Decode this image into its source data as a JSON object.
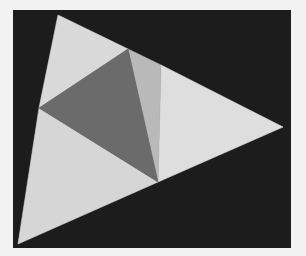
{
  "figure": {
    "background": {
      "x": 13,
      "y": 10,
      "width": 278,
      "height": 238,
      "color": "#1c1c1c"
    },
    "page_color": "#f2f2f2",
    "faces": [
      {
        "name": "top-left-face",
        "points": "58,15 128,49 39,108",
        "color": "#d9d9d9"
      },
      {
        "name": "bottom-left-face",
        "points": "39,108 158,182 18,244",
        "color": "#d6d6d6"
      },
      {
        "name": "right-face",
        "points": "161,65 283,127 158,182",
        "color": "#dedede"
      },
      {
        "name": "center-strip-face",
        "points": "128,49 161,65 158,182",
        "color": "#b9b9b9"
      },
      {
        "name": "center-dark-face",
        "points": "128,49 158,182 39,108",
        "color": "#6b6b6b"
      }
    ]
  }
}
